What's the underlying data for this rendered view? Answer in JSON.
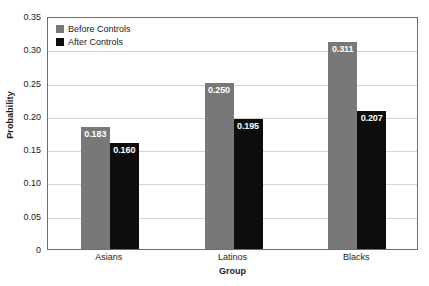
{
  "chart_data": {
    "type": "bar",
    "title": "",
    "xlabel": "Group",
    "ylabel": "Probability",
    "categories": [
      "Asians",
      "Latinos",
      "Blacks"
    ],
    "series": [
      {
        "name": "Before Controls",
        "color": "#787878",
        "values": [
          0.183,
          0.25,
          0.311
        ],
        "labels": [
          "0.183",
          "0.250",
          "0.311"
        ]
      },
      {
        "name": "After Controls",
        "color": "#0d0d0d",
        "values": [
          0.16,
          0.195,
          0.207
        ],
        "labels": [
          "0.160",
          "0.195",
          "0.207"
        ]
      }
    ],
    "ylim": [
      0,
      0.35
    ],
    "yticks": [
      0,
      0.05,
      0.1,
      0.15,
      0.2,
      0.25,
      0.3,
      0.35
    ],
    "ytick_labels": [
      "0",
      "0.05",
      "0.10",
      "0.15",
      "0.20",
      "0.25",
      "0.30",
      "0.35"
    ],
    "grid": true,
    "grid_axis": "y",
    "legend_position": "top-left",
    "value_labels_inside_top": true,
    "frame_color": "#6e6e6e",
    "grid_color": "#d4d4d4",
    "background": "#ffffff"
  }
}
